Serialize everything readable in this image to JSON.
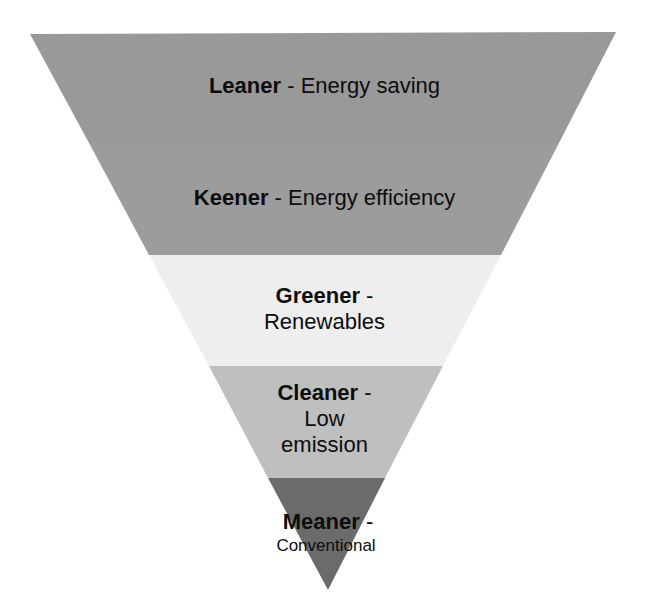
{
  "diagram": {
    "type": "inverted-pyramid",
    "levels": [
      {
        "key": "leaner",
        "title": "Leaner",
        "separator": " - ",
        "description": "Energy saving",
        "color": "#999999",
        "lines": [
          "Leaner - Energy saving"
        ]
      },
      {
        "key": "keener",
        "title": "Keener",
        "separator": " - ",
        "description": "Energy efficiency",
        "color": "#9c9c9c",
        "lines": [
          "Keener - Energy efficiency"
        ]
      },
      {
        "key": "greener",
        "title": "Greener",
        "separator": " -",
        "description": "Renewables",
        "color": "#eeeeee",
        "lines": [
          "Greener -",
          "Renewables"
        ]
      },
      {
        "key": "cleaner",
        "title": "Cleaner",
        "separator": " -",
        "description": "Low emission",
        "color": "#bfbfbf",
        "lines": [
          "Cleaner -",
          "Low",
          "emission"
        ]
      },
      {
        "key": "meaner",
        "title": "Meaner",
        "separator": " -",
        "description": "Conventional",
        "color": "#6b6b6b",
        "lines": [
          "Meaner -",
          "Conventional"
        ]
      }
    ]
  }
}
